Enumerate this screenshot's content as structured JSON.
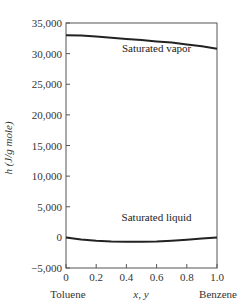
{
  "chart_data": {
    "type": "line",
    "title": "",
    "xlabel": "x, y",
    "ylabel": "h (J/g mole)",
    "xlim": [
      0,
      1.0
    ],
    "ylim": [
      -5000,
      35000
    ],
    "x_ticks": [
      0,
      0.2,
      0.4,
      0.6,
      0.8,
      1.0
    ],
    "x_tick_labels": [
      "0",
      "0.2",
      "0.4",
      "0.6",
      "0.8",
      "1.0"
    ],
    "y_ticks": [
      -5000,
      0,
      5000,
      10000,
      15000,
      20000,
      25000,
      30000,
      35000
    ],
    "y_tick_labels": [
      "−5,000",
      "0",
      "5,000",
      "10,000",
      "15,000",
      "20,000",
      "25,000",
      "30,000",
      "35,000"
    ],
    "x_end_labels": {
      "left": "Toluene",
      "right": "Benzene"
    },
    "grid": false,
    "series": [
      {
        "name": "Saturated vapor",
        "x": [
          0,
          0.1,
          0.2,
          0.3,
          0.4,
          0.5,
          0.6,
          0.7,
          0.8,
          0.9,
          1.0
        ],
        "values": [
          33000,
          32950,
          32800,
          32600,
          32400,
          32200,
          32000,
          31800,
          31500,
          31200,
          30800
        ]
      },
      {
        "name": "Saturated liquid",
        "x": [
          0,
          0.1,
          0.2,
          0.3,
          0.4,
          0.5,
          0.6,
          0.7,
          0.8,
          0.9,
          1.0
        ],
        "values": [
          0,
          -350,
          -550,
          -650,
          -700,
          -700,
          -650,
          -550,
          -400,
          -200,
          0
        ]
      }
    ],
    "annotations": [
      {
        "text": "Saturated vapor",
        "x": 0.6,
        "y": 30200
      },
      {
        "text": "Saturated liquid",
        "x": 0.6,
        "y": 2600
      }
    ]
  }
}
